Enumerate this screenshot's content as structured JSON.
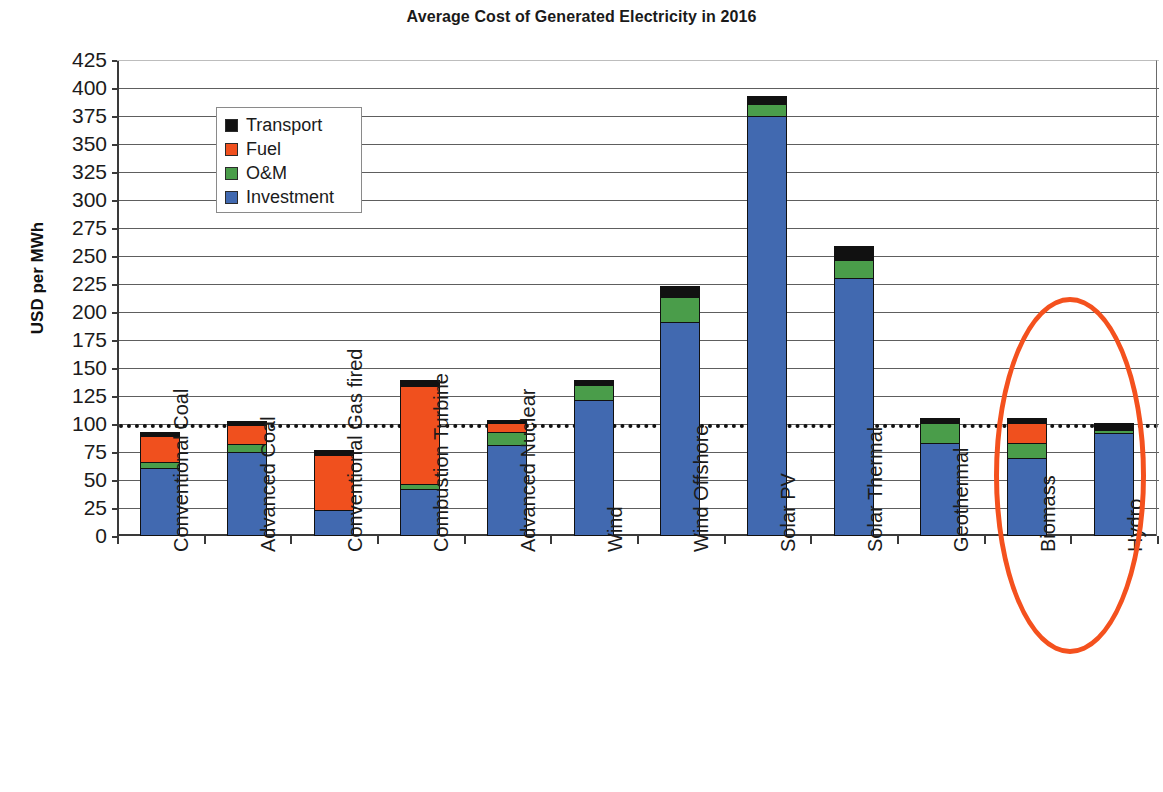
{
  "chart_data": {
    "type": "bar",
    "subtype": "stacked-bar",
    "title": "Average Cost of Generated Electricity in 2016",
    "xlabel": "",
    "ylabel": "USD per MWh",
    "ylim": [
      0,
      425
    ],
    "ytick_step": 25,
    "yticks": [
      "0",
      "25",
      "50",
      "75",
      "100",
      "125",
      "150",
      "175",
      "200",
      "225",
      "250",
      "275",
      "300",
      "325",
      "350",
      "375",
      "400",
      "425"
    ],
    "grid": true,
    "legend_position": "inside-upper-left",
    "categories": [
      "Conventional Coal",
      "Advanced Coal",
      "Conventional Gas fired",
      "Combustion Turbine",
      "Advanced Nuclear",
      "Wind",
      "Wind Offshore",
      "Solar PV",
      "Solar Thermal",
      "Geothermal",
      "Biomass",
      "Hydro"
    ],
    "series": [
      {
        "name": "Investment",
        "color": "#4169B0",
        "values": [
          61,
          75,
          23,
          42,
          81,
          121,
          191,
          375,
          230,
          83,
          70,
          92
        ]
      },
      {
        "name": "O&M",
        "color": "#4A9D4A",
        "values": [
          5,
          7,
          0,
          4,
          12,
          14,
          22,
          11,
          16,
          18,
          13,
          3
        ]
      },
      {
        "name": "Fuel",
        "color": "#F0501E",
        "values": [
          23,
          17,
          49,
          88,
          8,
          0,
          0,
          0,
          0,
          0,
          18,
          0
        ]
      },
      {
        "name": "Transport",
        "color": "#111111",
        "values": [
          4,
          4,
          5,
          5,
          3,
          4,
          10,
          7,
          13,
          4,
          4,
          6
        ]
      }
    ],
    "totals": [
      93,
      103,
      77,
      139,
      104,
      139,
      223,
      393,
      259,
      105,
      105,
      101
    ],
    "reference_line": {
      "value": 100,
      "style": "dotted",
      "color": "#111111"
    },
    "annotations": [
      {
        "type": "ellipse",
        "name": "highlight-ellipse",
        "target": "Hydro",
        "color": "#F4511E"
      }
    ]
  },
  "legend": {
    "items": [
      {
        "label": "Transport",
        "color": "#111111"
      },
      {
        "label": "Fuel",
        "color": "#F0501E"
      },
      {
        "label": "O&M",
        "color": "#4A9D4A"
      },
      {
        "label": "Investment",
        "color": "#4169B0"
      }
    ]
  },
  "footer": {
    "note": ""
  }
}
